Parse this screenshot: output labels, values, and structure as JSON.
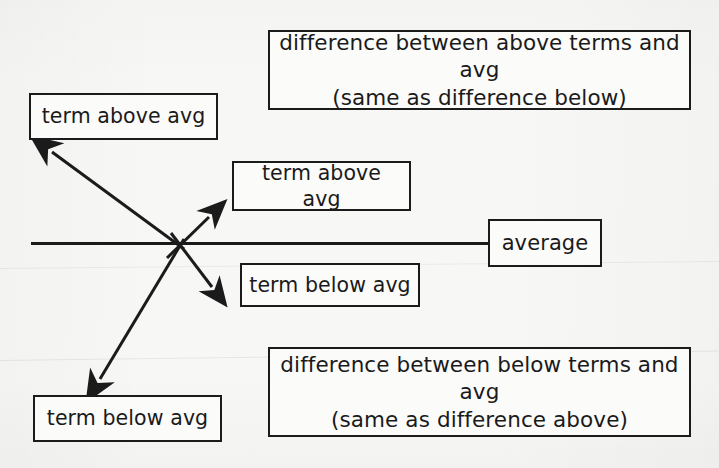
{
  "diagram": {
    "background_color": "#f7f7f6",
    "stroke_color": "#1b1b1b",
    "boxes": {
      "difference_above": {
        "line1": "difference between above terms and avg",
        "line2": "(same as difference below)"
      },
      "difference_below": {
        "line1": "difference between below terms and avg",
        "line2": "(same as difference above)"
      },
      "term_above_left": "term above avg",
      "term_above_middle": "term above avg",
      "term_below_middle": "term below avg",
      "term_below_left": "term below avg",
      "average": "average"
    },
    "arrows": [
      {
        "name": "long-arrow-up-left",
        "from": [
          183,
          247
        ],
        "to": [
          48,
          148
        ],
        "points_to": "term above avg (left box)"
      },
      {
        "name": "long-arrow-down-left",
        "from": [
          183,
          240
        ],
        "to": [
          96,
          385
        ],
        "points_to": "term below avg (bottom-left box)"
      },
      {
        "name": "short-arrow-up-right",
        "from": [
          168,
          256
        ],
        "to": [
          214,
          211
        ],
        "points_to": "term above avg (middle box)"
      },
      {
        "name": "short-arrow-down-right",
        "from": [
          172,
          234
        ],
        "to": [
          217,
          293
        ],
        "points_to": "term below avg (middle box)"
      }
    ],
    "average_line": {
      "name": "average-baseline",
      "from": [
        31,
        243
      ],
      "to": [
        488,
        243
      ]
    }
  }
}
